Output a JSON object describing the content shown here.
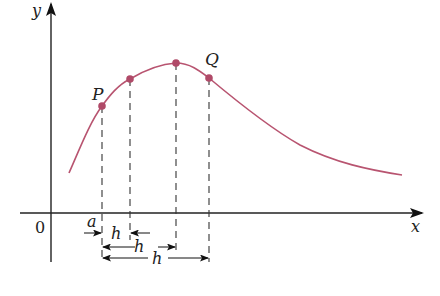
{
  "diagram": {
    "title": "",
    "axes": {
      "x_label": "x",
      "y_label": "y",
      "origin_label": "0"
    },
    "curve": {
      "color": "#b85470",
      "description": "smooth curve rising to a maximum then decaying"
    },
    "points": [
      {
        "label": "P",
        "role": "point at a"
      },
      {
        "label": "",
        "role": "point at a+h (small h)"
      },
      {
        "label": "",
        "role": "point at a+h (medium h)"
      },
      {
        "label": "Q",
        "role": "point at a+h (large h)"
      }
    ],
    "annotations": {
      "a_label": "a",
      "h_labels": [
        "h",
        "h",
        "h"
      ]
    },
    "point_color": "#b04a68",
    "axis_color": "#222222",
    "dash_color": "#333333"
  }
}
